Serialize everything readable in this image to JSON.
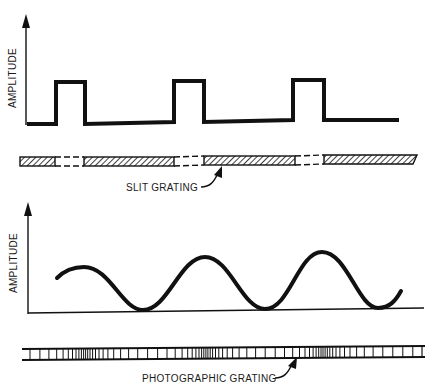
{
  "figure": {
    "top_panel": {
      "ylabel": "AMPLITUDE",
      "waveform": "square-pulse",
      "pulse_count": 3,
      "grating_label": "SLIT GRATING"
    },
    "bottom_panel": {
      "ylabel": "AMPLITUDE",
      "waveform": "sinusoid",
      "peak_count": 3,
      "grating_label": "PHOTOGRAPHIC GRATING"
    },
    "colors": {
      "ink": "#111111",
      "background": "#ffffff"
    }
  }
}
